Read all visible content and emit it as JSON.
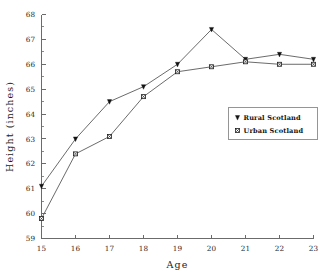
{
  "chart_data": {
    "type": "line",
    "title": "",
    "xlabel": "Age",
    "ylabel": "Height (inches)",
    "x": [
      15,
      16,
      17,
      18,
      19,
      20,
      21,
      22,
      23
    ],
    "xticklabels": [
      "15",
      "16",
      "17",
      "18",
      "19",
      "20",
      "21",
      "22",
      "23"
    ],
    "yticklabels": [
      "59",
      "60",
      "61",
      "62",
      "63",
      "64",
      "65",
      "66",
      "67",
      "68"
    ],
    "xlim": [
      15,
      23
    ],
    "ylim": [
      59,
      68
    ],
    "grid": false,
    "legend_position": "center-right",
    "series": [
      {
        "name": "Rural Scotland",
        "marker": "filled-down-triangle",
        "values": [
          61.1,
          63.0,
          64.5,
          65.1,
          66.0,
          67.4,
          66.2,
          66.4,
          66.2
        ]
      },
      {
        "name": "Urban Scotland",
        "marker": "square-with-x",
        "values": [
          59.8,
          62.4,
          63.1,
          64.7,
          65.7,
          65.9,
          66.1,
          66.0,
          66.0
        ]
      }
    ]
  },
  "axes": {
    "x_title": "Age",
    "y_title": "Height (inches)"
  },
  "legend": {
    "entries": [
      {
        "label": "Rural Scotland",
        "marker": "filled-down-triangle"
      },
      {
        "label": "Urban Scotland",
        "marker": "square-with-x"
      }
    ]
  }
}
